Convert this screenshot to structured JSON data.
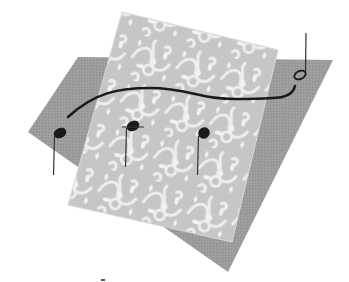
{
  "illustration": {
    "description": "Musical notes connected by a slur over a damask-patterned sheet and a gray sheet",
    "colors": {
      "background": "#ffffff",
      "back_sheet": "#9a9a9a",
      "damask_sheet": "#c4c4c4",
      "damask_pattern": "#eeeeee",
      "ink": "#1a1a1a"
    },
    "notes": [
      {
        "type": "filled",
        "head_x": 60,
        "head_y": 133,
        "stem": "down"
      },
      {
        "type": "filled",
        "head_x": 133,
        "head_y": 126,
        "stem": "down"
      },
      {
        "type": "filled",
        "head_x": 204,
        "head_y": 133,
        "stem": "down"
      },
      {
        "type": "open",
        "head_x": 300,
        "head_y": 75,
        "stem": "up"
      }
    ]
  }
}
